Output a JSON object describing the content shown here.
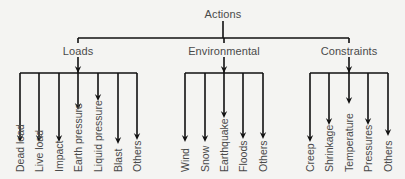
{
  "diagram": {
    "root": {
      "label": "Actions",
      "x": 223,
      "y": 8
    },
    "groups": [
      {
        "label": "Loads",
        "x": 78,
        "bar": [
          20,
          137
        ],
        "children": [
          {
            "label": "Dead load",
            "x": 20,
            "tip": 142
          },
          {
            "label": "Live load",
            "x": 39,
            "tip": 142
          },
          {
            "label": "Impact",
            "x": 59,
            "tip": 142
          },
          {
            "label": "Earth pressure",
            "x": 78,
            "tip": 110
          },
          {
            "label": "Liquid pressure",
            "x": 98,
            "tip": 101
          },
          {
            "label": "Blast",
            "x": 118,
            "tip": 144
          },
          {
            "label": "Others",
            "x": 137,
            "tip": 140
          }
        ]
      },
      {
        "label": "Environmental",
        "x": 224,
        "bar": [
          185,
          263
        ],
        "children": [
          {
            "label": "Wind",
            "x": 185,
            "tip": 142
          },
          {
            "label": "Snow",
            "x": 205,
            "tip": 142
          },
          {
            "label": "Earthquake",
            "x": 224,
            "tip": 118
          },
          {
            "label": "Floods",
            "x": 243,
            "tip": 139
          },
          {
            "label": "Others",
            "x": 263,
            "tip": 139
          }
        ]
      },
      {
        "label": "Constraints",
        "x": 349,
        "bar": [
          310,
          388
        ],
        "children": [
          {
            "label": "Creep",
            "x": 310,
            "tip": 142
          },
          {
            "label": "Shrinkage",
            "x": 329,
            "tip": 125
          },
          {
            "label": "Temperature",
            "x": 349,
            "tip": 104
          },
          {
            "label": "Pressures",
            "x": 368,
            "tip": 125
          },
          {
            "label": "Others",
            "x": 388,
            "tip": 136
          }
        ]
      }
    ],
    "colors": {
      "line": "#111111",
      "text": "#4a4a4a",
      "background": "#f4f4f2"
    }
  }
}
